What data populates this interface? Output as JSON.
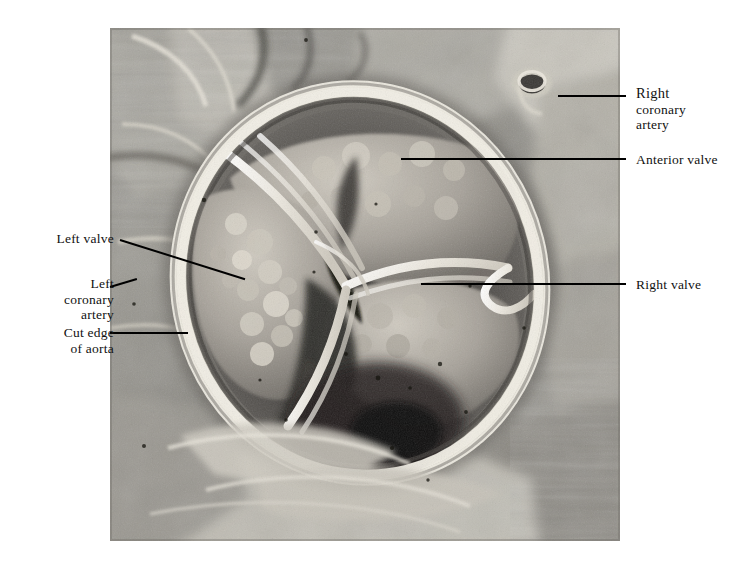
{
  "figure": {
    "kind": "anatomical-photograph",
    "palette": {
      "background": "#ffffff",
      "leader_line": "#000000",
      "label_text": "#111111",
      "photo_mid_tone": "#8d8d8d",
      "photo_highlight": "#f2f0ea",
      "photo_shadow": "#1d1d1d"
    }
  },
  "labels": [
    {
      "id": "right-coronary-artery",
      "lines": [
        "Right",
        "coronary",
        "artery"
      ],
      "side": "right",
      "text_x": 636,
      "text_y": 86,
      "leader": {
        "x1": 558,
        "y1": 96,
        "x2": 626,
        "y2": 96
      }
    },
    {
      "id": "anterior-valve",
      "lines": [
        "Anterior valve"
      ],
      "side": "right",
      "text_x": 636,
      "text_y": 152,
      "leader": {
        "x1": 401,
        "y1": 159,
        "x2": 626,
        "y2": 159
      }
    },
    {
      "id": "right-valve",
      "lines": [
        "Right valve"
      ],
      "side": "right",
      "text_x": 636,
      "text_y": 277,
      "leader": {
        "x1": 421,
        "y1": 284,
        "x2": 626,
        "y2": 284
      }
    },
    {
      "id": "left-valve",
      "lines": [
        "Left valve"
      ],
      "side": "left",
      "text_x": 114,
      "text_y": 231,
      "leader": {
        "x1": 120,
        "y1": 240,
        "x2": 245,
        "y2": 279
      }
    },
    {
      "id": "left-coronary-artery",
      "lines": [
        "Left",
        "coronary",
        "artery"
      ],
      "side": "left",
      "text_x": 114,
      "text_y": 276,
      "leader": {
        "x1": 110,
        "y1": 287,
        "x2": 137,
        "y2": 279
      }
    },
    {
      "id": "cut-edge-of-aorta",
      "lines": [
        "Cut edge",
        "of aorta"
      ],
      "side": "left",
      "text_x": 114,
      "text_y": 326,
      "leader": {
        "x1": 110,
        "y1": 333,
        "x2": 188,
        "y2": 333
      }
    }
  ],
  "photo": {
    "left": 110,
    "top": 28,
    "width": 510,
    "height": 513,
    "description": "Greyscale dissection photograph. A bright whitish elliptical rim (cut edge of the great vessel) encircles the valve orifice; three cusps with nodular free margins meet at the centre; surrounding myocardium and epicardial fat fill the frame. A small circular cut coronary vessel lumen appears at upper right."
  }
}
